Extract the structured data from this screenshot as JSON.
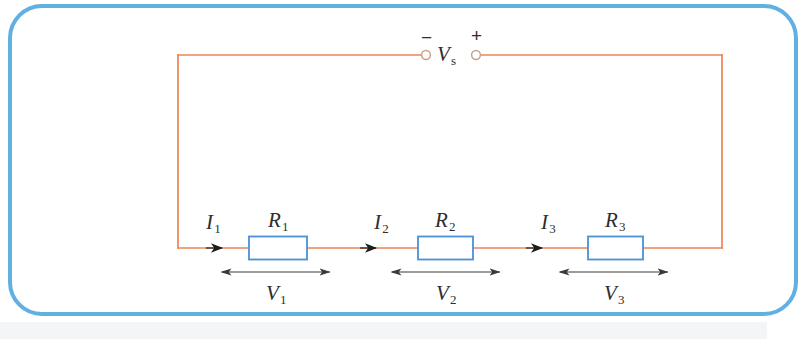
{
  "figure": {
    "type": "series-circuit-diagram",
    "frame_color": "#62b0e2",
    "wire_color": "#ef8354",
    "resistor_border_color": "#4a90d9",
    "resistor_fill": "#ffffff",
    "label_color": "#2e2e2e",
    "arrow_color": "#3a3a3a"
  },
  "source": {
    "label_main": "V",
    "label_sub": "s",
    "minus_sign": "−",
    "plus_sign": "+",
    "minus_terminal_name": "negative-terminal",
    "plus_terminal_name": "positive-terminal"
  },
  "stages": [
    {
      "current_main": "I",
      "current_sub": "1",
      "resistor_main": "R",
      "resistor_sub": "1",
      "voltage_main": "V",
      "voltage_sub": "1"
    },
    {
      "current_main": "I",
      "current_sub": "2",
      "resistor_main": "R",
      "resistor_sub": "2",
      "voltage_main": "V",
      "voltage_sub": "2"
    },
    {
      "current_main": "I",
      "current_sub": "3",
      "resistor_main": "R",
      "resistor_sub": "3",
      "voltage_main": "V",
      "voltage_sub": "3"
    }
  ]
}
